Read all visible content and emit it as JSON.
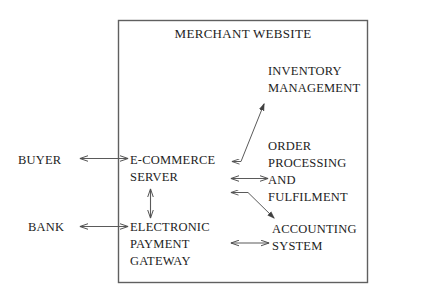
{
  "diagram": {
    "type": "flow-diagram",
    "boundary": {
      "title": "MERCHANT WEBSITE",
      "shape": "rectangle",
      "stroke_color": "#555555"
    },
    "external_nodes": [
      {
        "id": "buyer",
        "label": "BUYER"
      },
      {
        "id": "bank",
        "label": "BANK"
      }
    ],
    "internal_nodes": [
      {
        "id": "ecommerce_server",
        "label": "E-COMMERCE\nSERVER"
      },
      {
        "id": "electronic_payment_gateway",
        "label": "ELECTRONIC\nPAYMENT\nGATEWAY"
      },
      {
        "id": "inventory_management",
        "label": "INVENTORY\nMANAGEMENT"
      },
      {
        "id": "order_processing",
        "label": "ORDER\nPROCESSING\nAND FULFILMENT"
      },
      {
        "id": "accounting_system",
        "label": "ACCOUNTING\nSYSTEM"
      }
    ],
    "connections": [
      {
        "from": "buyer",
        "to": "ecommerce_server",
        "arrow": "double"
      },
      {
        "from": "bank",
        "to": "electronic_payment_gateway",
        "arrow": "double"
      },
      {
        "from": "ecommerce_server",
        "to": "electronic_payment_gateway",
        "arrow": "double"
      },
      {
        "from": "order_processing",
        "to": "inventory_management",
        "arrow": "single"
      },
      {
        "from": "ecommerce_server",
        "to": "order_processing",
        "arrow": "double"
      },
      {
        "from": "ecommerce_server",
        "to": "accounting_system",
        "arrow": "single"
      },
      {
        "from": "electronic_payment_gateway",
        "to": "accounting_system",
        "arrow": "double"
      }
    ],
    "colors": {
      "line": "#5a5a5a",
      "text": "#1d1d1d",
      "background": "#ffffff"
    }
  }
}
